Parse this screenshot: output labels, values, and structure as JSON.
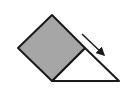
{
  "diagram": {
    "colors": {
      "background": "#ffffff",
      "square_fill": "#a6a6a6",
      "stroke": "#1a1a1a",
      "arrow": "#1a1a1a"
    },
    "square": {
      "points": "52,15 18,48 52,81 85,48"
    },
    "incline": {
      "points": "52,81 85,48 119,81"
    },
    "arrow": {
      "x1": 82,
      "y1": 34,
      "x2": 104,
      "y2": 55
    }
  }
}
